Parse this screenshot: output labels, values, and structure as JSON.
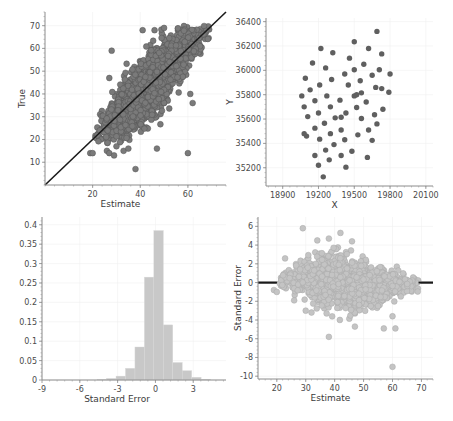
{
  "chart_data": [
    {
      "id": "true-vs-estimate",
      "type": "scatter",
      "title": "",
      "xlabel": "Estimate",
      "ylabel": "True",
      "xlim": [
        0,
        76
      ],
      "ylim": [
        0,
        76
      ],
      "xticks": [
        20,
        40,
        60
      ],
      "yticks": [
        10,
        20,
        30,
        40,
        50,
        60,
        70
      ],
      "grid": true,
      "reference_line": {
        "type": "identity",
        "from": [
          0,
          0
        ],
        "to": [
          76,
          76
        ],
        "color": "#1a1a1a"
      },
      "marker_color": "#7a7a7a",
      "marker_edge": "#555555",
      "point_count_approx": 2000,
      "distribution": {
        "mean_estimate": 45,
        "sd_estimate": 9.5,
        "correlation": 0.72,
        "sd_true": 11
      },
      "outliers": [
        [
          38,
          7
        ],
        [
          47,
          16
        ],
        [
          60,
          14
        ],
        [
          28,
          59
        ],
        [
          41,
          68
        ],
        [
          46,
          68
        ],
        [
          50,
          69
        ],
        [
          19,
          14
        ],
        [
          20,
          14
        ],
        [
          26,
          15
        ],
        [
          27,
          14
        ],
        [
          29,
          13
        ],
        [
          30,
          17
        ],
        [
          33,
          15
        ],
        [
          35,
          16
        ],
        [
          61,
          40
        ],
        [
          62,
          36
        ],
        [
          27,
          47
        ]
      ]
    },
    {
      "id": "y-vs-x",
      "type": "scatter",
      "title": "",
      "xlabel": "X",
      "ylabel": "Y",
      "xlim": [
        18760,
        20160
      ],
      "ylim": [
        35050,
        36430
      ],
      "xticks": [
        18900,
        19200,
        19500,
        19800,
        20100
      ],
      "yticks": [
        35200,
        35400,
        35600,
        35800,
        36000,
        36200,
        36400
      ],
      "grid": true,
      "marker_color": "#5f5f5f",
      "points": [
        [
          19690,
          36320
        ],
        [
          19500,
          36235
        ],
        [
          19220,
          36180
        ],
        [
          19620,
          36180
        ],
        [
          19320,
          36145
        ],
        [
          19730,
          36135
        ],
        [
          19150,
          36060
        ],
        [
          19460,
          36100
        ],
        [
          19580,
          36050
        ],
        [
          19260,
          36020
        ],
        [
          19090,
          35935
        ],
        [
          19420,
          35970
        ],
        [
          19500,
          36005
        ],
        [
          19710,
          36005
        ],
        [
          19800,
          35970
        ],
        [
          19130,
          35840
        ],
        [
          19210,
          35880
        ],
        [
          19310,
          35925
        ],
        [
          19450,
          35880
        ],
        [
          19550,
          35915
        ],
        [
          19650,
          35960
        ],
        [
          19680,
          35860
        ],
        [
          19730,
          35850
        ],
        [
          19060,
          35790
        ],
        [
          19170,
          35750
        ],
        [
          19270,
          35790
        ],
        [
          19380,
          35755
        ],
        [
          19500,
          35790
        ],
        [
          19520,
          35800
        ],
        [
          19560,
          35815
        ],
        [
          19080,
          35700
        ],
        [
          19200,
          35650
        ],
        [
          19300,
          35700
        ],
        [
          19390,
          35615
        ],
        [
          19600,
          35740
        ],
        [
          19790,
          35820
        ],
        [
          19110,
          35620
        ],
        [
          19250,
          35565
        ],
        [
          19340,
          35610
        ],
        [
          19430,
          35650
        ],
        [
          19520,
          35695
        ],
        [
          19560,
          35605
        ],
        [
          19670,
          35635
        ],
        [
          19740,
          35680
        ],
        [
          19080,
          35480
        ],
        [
          19100,
          35460
        ],
        [
          19170,
          35525
        ],
        [
          19300,
          35480
        ],
        [
          19390,
          35510
        ],
        [
          19530,
          35470
        ],
        [
          19620,
          35510
        ],
        [
          19690,
          35560
        ],
        [
          19210,
          35435
        ],
        [
          19330,
          35390
        ],
        [
          19420,
          35430
        ],
        [
          19650,
          35425
        ],
        [
          19170,
          35300
        ],
        [
          19260,
          35345
        ],
        [
          19390,
          35300
        ],
        [
          19480,
          35335
        ],
        [
          19610,
          35285
        ],
        [
          19200,
          35220
        ],
        [
          19290,
          35265
        ],
        [
          19430,
          35205
        ],
        [
          19240,
          35125
        ]
      ]
    },
    {
      "id": "standard-error-histogram",
      "type": "bar",
      "title": "",
      "xlabel": "Standard Error",
      "ylabel": "",
      "xlim": [
        -9,
        5.6
      ],
      "ylim": [
        0,
        0.42
      ],
      "xticks": [
        -9,
        -6,
        -3,
        0,
        3
      ],
      "yticks": [
        0,
        0.05,
        0.1,
        0.15,
        0.2,
        0.25,
        0.3,
        0.35,
        0.4
      ],
      "ytick_labels": [
        "0",
        "0.05",
        "0.1",
        "0.15",
        "0.2",
        "0.25",
        "0.3",
        "0.35",
        "0.4"
      ],
      "grid": true,
      "bar_color": "#c8c8c8",
      "bin_width": 0.75,
      "bin_edges": [
        -4.625,
        -3.875,
        -3.125,
        -2.375,
        -1.625,
        -0.875,
        -0.125,
        0.625,
        1.375,
        2.125,
        2.875,
        3.625,
        4.375
      ],
      "values": [
        0.001,
        0.004,
        0.01,
        0.03,
        0.085,
        0.265,
        0.385,
        0.142,
        0.045,
        0.024,
        0.007,
        0.002
      ]
    },
    {
      "id": "standard-error-vs-estimate",
      "type": "scatter",
      "title": "",
      "xlabel": "Estimate",
      "ylabel": "Standard Error",
      "xlim": [
        13.5,
        74
      ],
      "ylim": [
        -10.3,
        7
      ],
      "xticks": [
        20,
        30,
        40,
        50,
        60,
        70
      ],
      "yticks": [
        -10,
        -8,
        -6,
        -4,
        -2,
        0,
        2,
        4,
        6
      ],
      "grid": true,
      "reference_line": {
        "type": "horizontal",
        "y": 0,
        "color": "#1a1a1a"
      },
      "marker_color": "#c4c4c4",
      "marker_edge": "#a8a8a8",
      "point_count_approx": 2000,
      "outliers": [
        [
          29,
          5.8
        ],
        [
          42,
          5.3
        ],
        [
          38,
          4.7
        ],
        [
          34,
          4.5
        ],
        [
          46,
          4.4
        ],
        [
          38,
          -5.8
        ],
        [
          60,
          -9
        ],
        [
          19,
          -0.8
        ],
        [
          20,
          -1
        ],
        [
          61,
          -4.9
        ],
        [
          57,
          -4.9
        ],
        [
          47,
          -4.7
        ],
        [
          32,
          -3.2
        ],
        [
          30,
          -3.0
        ],
        [
          26,
          -1.9
        ],
        [
          60,
          -3.6
        ]
      ]
    }
  ]
}
